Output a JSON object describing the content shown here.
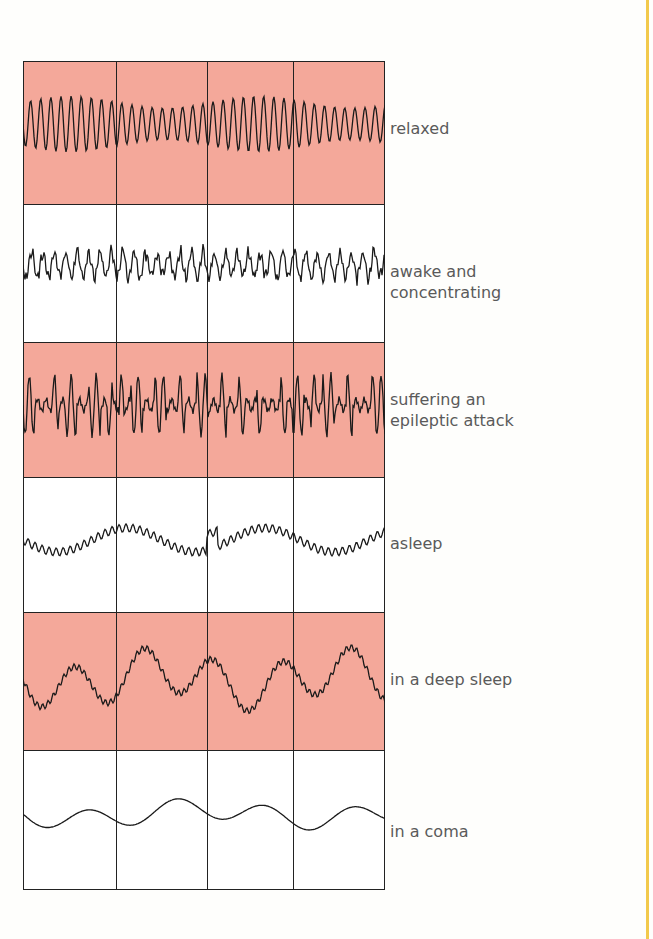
{
  "diagram": {
    "title": "",
    "colors": {
      "pink_band": "#f4a89a",
      "white_band": "#ffffff",
      "trace": "#1a1a1a",
      "label_text": "#5a5a5a",
      "side_rule": "#f2c94c"
    },
    "rows": [
      {
        "label_line1": "relaxed",
        "label_line2": "",
        "shaded": true,
        "pattern": "regular-high-frequency"
      },
      {
        "label_line1": "awake and",
        "label_line2": "concentrating",
        "shaded": false,
        "pattern": "irregular-low-amplitude"
      },
      {
        "label_line1": "suffering an",
        "label_line2": "epileptic attack",
        "shaded": true,
        "pattern": "spiky-high-amplitude"
      },
      {
        "label_line1": "asleep",
        "label_line2": "",
        "shaded": false,
        "pattern": "slow-wavy"
      },
      {
        "label_line1": "in a deep sleep",
        "label_line2": "",
        "shaded": true,
        "pattern": "slow-large-amplitude"
      },
      {
        "label_line1": "in a coma",
        "label_line2": "",
        "shaded": false,
        "pattern": "very-slow-flat"
      }
    ]
  }
}
